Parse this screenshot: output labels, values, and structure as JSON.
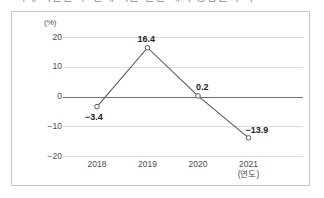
{
  "caption": {
    "text": "○ 가계 지출을 구 분에 따른 전년 대비 증감률 추이"
  },
  "chart_data": {
    "type": "line",
    "title": "",
    "xlabel": "(연도)",
    "ylabel": "(%)",
    "unit": "(%)",
    "categories": [
      "2018",
      "2019",
      "2020",
      "2021"
    ],
    "values": [
      -3.4,
      16.4,
      0.2,
      -13.9
    ],
    "point_labels": [
      "−3.4",
      "16.4",
      "0.2",
      "−13.9"
    ],
    "ylim": [
      -20,
      20
    ],
    "yticks": [
      20,
      10,
      0,
      -10,
      -20
    ],
    "ytick_labels": [
      "20",
      "10",
      "0",
      "−10",
      "−20"
    ],
    "grid": true,
    "legend": "none",
    "zero_line": true,
    "marker": "open-circle",
    "line_color": "#58585d",
    "grid_color": "#dcdcdf",
    "zero_line_color": "#6e6e73",
    "frame_color": "#c9c9cd",
    "text_color": "#4b4b50"
  }
}
